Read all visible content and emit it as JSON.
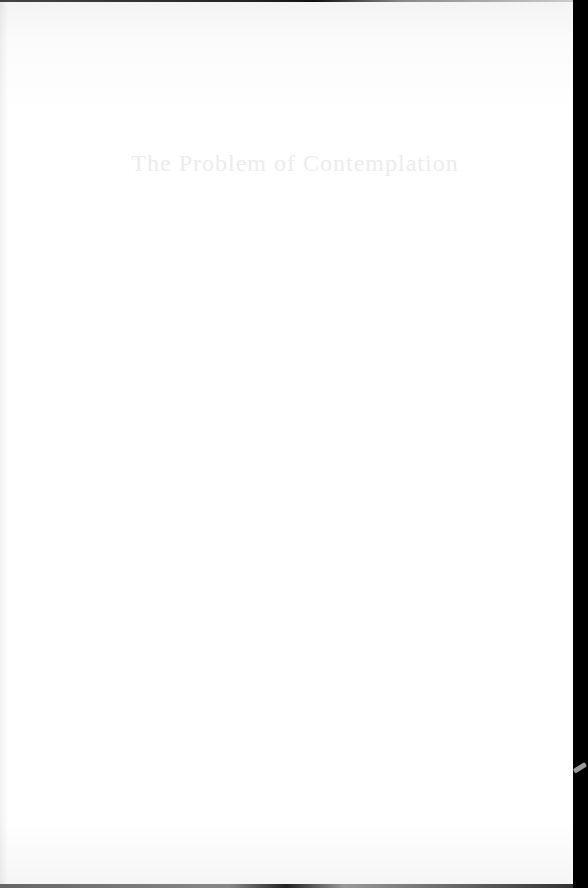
{
  "document": {
    "type": "scanned-book-page",
    "chapter_title": "The Problem of Contemplation"
  },
  "colors": {
    "page_background": "#ffffff",
    "title_text": "#ececec",
    "scan_border": "#000000"
  }
}
